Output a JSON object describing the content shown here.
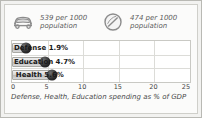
{
  "panel": {
    "background_color": "#fbfbfa",
    "frame_color": "#b9b9b4"
  },
  "stats": [
    {
      "icon": "car-icon",
      "value": "539 per 1000",
      "unit": "population"
    },
    {
      "icon": "ball-icon",
      "value": "474 per 1000",
      "unit": "population"
    }
  ],
  "chart_data": {
    "type": "bar",
    "orientation": "horizontal",
    "title": "",
    "caption": "Defense, Health, Education spending as % of GDP",
    "xlabel": "",
    "ylabel": "",
    "categories": [
      "Defense",
      "Education",
      "Health"
    ],
    "values": [
      1.9,
      4.7,
      5.6
    ],
    "value_labels": [
      "Defense 1.9%",
      "Education 4.7%",
      "Health 5.6%"
    ],
    "xlim": [
      0,
      25
    ],
    "xticks": [
      "0",
      "5",
      "10",
      "15",
      "20",
      "25"
    ],
    "xtick_values": [
      0,
      5,
      10,
      15,
      20,
      25
    ],
    "grid": true,
    "legend": "none",
    "bar_color": "#d0d0d0",
    "marker_color": "#1a1a1a"
  }
}
